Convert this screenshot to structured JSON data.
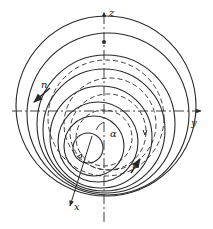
{
  "diagram": {
    "type": "nested circles with coordinate axes",
    "colors": {
      "stroke": "#2a2a2a",
      "background": "#ffffff"
    },
    "axes": {
      "z": {
        "label": "z"
      },
      "y": {
        "label": "y"
      },
      "x": {
        "label": "x"
      }
    },
    "labels": {
      "n_upper": "n",
      "n_lower": "n",
      "alpha": "α"
    },
    "solid_circles": [
      {
        "cx": 106,
        "cy": 106,
        "r": 90
      },
      {
        "cx": 108,
        "cy": 114,
        "r": 81
      },
      {
        "cx": 106,
        "cy": 124,
        "r": 69
      },
      {
        "cx": 104,
        "cy": 130,
        "r": 61
      },
      {
        "cx": 101,
        "cy": 137,
        "r": 51
      },
      {
        "cx": 98,
        "cy": 142,
        "r": 40
      },
      {
        "cx": 94,
        "cy": 146,
        "r": 30
      },
      {
        "cx": 88,
        "cy": 148,
        "r": 15
      }
    ],
    "dashed_circles": [
      {
        "cx": 106,
        "cy": 118,
        "r": 58
      },
      {
        "cx": 110,
        "cy": 124,
        "r": 46
      },
      {
        "cx": 108,
        "cy": 132,
        "r": 38
      },
      {
        "cx": 104,
        "cy": 138,
        "r": 28
      }
    ]
  }
}
